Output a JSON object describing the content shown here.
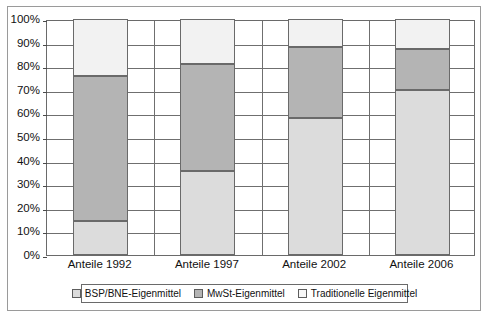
{
  "chart_data": {
    "type": "bar",
    "subtype": "stacked-percentage-column",
    "title": "",
    "xlabel": "",
    "ylabel": "",
    "categories": [
      "Anteile 1992",
      "Anteile 1997",
      "Anteile 2002",
      "Anteile 2006"
    ],
    "series": [
      {
        "name": "BSP/BNE-Eigenmittel",
        "color": "#dcdcdc",
        "values": [
          14.5,
          35.5,
          58.0,
          70.0
        ]
      },
      {
        "name": "MwSt-Eigenmittel",
        "color": "#b4b4b4",
        "values": [
          61.5,
          45.5,
          30.0,
          17.5
        ]
      },
      {
        "name": "Traditionelle Eigenmittel",
        "color": "#f2f2f2",
        "values": [
          24.0,
          19.0,
          12.0,
          12.5
        ]
      }
    ],
    "stack_order_bottom_to_top": [
      "BSP/BNE-Eigenmittel",
      "MwSt-Eigenmittel",
      "Traditionelle Eigenmittel"
    ],
    "cumulative_tops": [
      [
        14.5,
        76.0,
        100.0
      ],
      [
        35.5,
        81.0,
        100.0
      ],
      [
        58.0,
        88.0,
        100.0
      ],
      [
        70.0,
        87.5,
        100.0
      ]
    ],
    "ylim": [
      0,
      100
    ],
    "ytick_values": [
      0,
      10,
      20,
      30,
      40,
      50,
      60,
      70,
      80,
      90,
      100
    ],
    "ytick_labels": [
      "0%",
      "10%",
      "20%",
      "30%",
      "40%",
      "50%",
      "60%",
      "70%",
      "80%",
      "90%",
      "100%"
    ],
    "grid": "horizontal",
    "legend_position": "bottom",
    "legend_entries": [
      "BSP/BNE-Eigenmittel",
      "MwSt-Eigenmittel",
      "Traditionelle Eigenmittel"
    ]
  },
  "axis": {
    "ytick_labels": [
      "100%",
      "90%",
      "80%",
      "70%",
      "60%",
      "50%",
      "40%",
      "30%",
      "20%",
      "10%",
      "0%"
    ]
  },
  "legend": {
    "items": [
      {
        "label": "BSP/BNE-Eigenmittel",
        "color": "#dcdcdc"
      },
      {
        "label": "MwSt-Eigenmittel",
        "color": "#b4b4b4"
      },
      {
        "label": "Traditionelle Eigenmittel",
        "color": "#f7f7f7"
      }
    ]
  }
}
